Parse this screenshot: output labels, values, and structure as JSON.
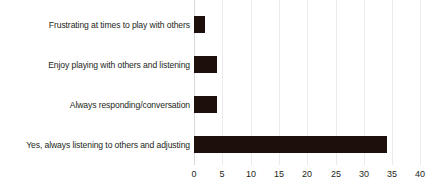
{
  "chart_data": {
    "type": "bar",
    "orientation": "horizontal",
    "title": "",
    "subtitle": "",
    "xlabel": "",
    "ylabel": "",
    "categories": [
      "Yes, always listening to others and adjusting",
      "Always responding/conversation",
      "Enjoy playing with others and listening",
      "Frustrating at times to play with others"
    ],
    "values": [
      34,
      4,
      4,
      2
    ],
    "series": [
      {
        "name": "Responses",
        "values": [
          34,
          4,
          4,
          2
        ]
      }
    ],
    "xlim": [
      0,
      40
    ],
    "xticks": [
      0,
      5,
      10,
      15,
      20,
      25,
      30,
      35,
      40
    ],
    "xtick_labels": [
      "0",
      "5",
      "10",
      "15",
      "20",
      "25",
      "30",
      "35",
      "40"
    ],
    "grid": true,
    "grid_axis": "x",
    "legend": false,
    "legend_position": "none",
    "bar_color": "#1d100c",
    "grid_color": "#ebebeb",
    "axis_color": "#d9d9d9",
    "text_color": "#231f20",
    "background": "#ffffff"
  }
}
